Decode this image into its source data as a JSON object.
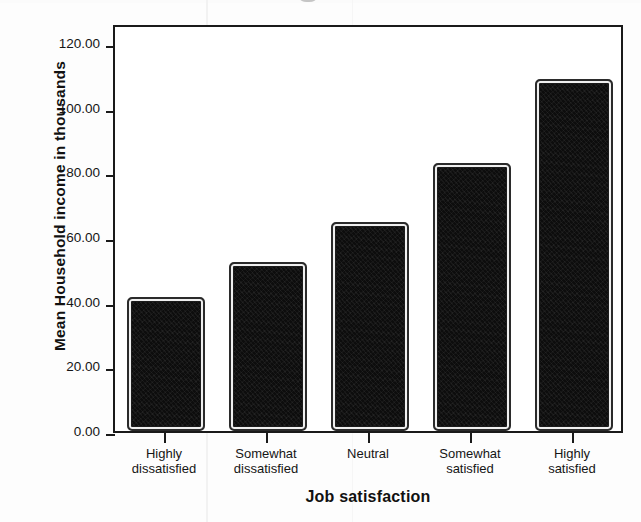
{
  "chart_data": {
    "type": "bar",
    "title": "",
    "xlabel": "Job satisfaction",
    "ylabel": "Mean Household income in thousands",
    "categories": [
      "Highly dissatisfied",
      "Somewhat dissatisfied",
      "Neutral",
      "Somewhat satisfied",
      "Highly satisfied"
    ],
    "category_lines": [
      [
        "Highly",
        "dissatisfied"
      ],
      [
        "Somewhat",
        "dissatisfied"
      ],
      [
        "Neutral",
        ""
      ],
      [
        "Somewhat",
        "satisfied"
      ],
      [
        "Highly",
        "satisfied"
      ]
    ],
    "values": [
      41.5,
      52.3,
      64.6,
      82.8,
      108.9
    ],
    "ylim": [
      0,
      130
    ],
    "yticks": [
      0,
      20,
      40,
      60,
      80,
      100,
      120
    ],
    "ytick_labels": [
      "0.00",
      "20.00",
      "40.00",
      "60.00",
      "80.00",
      "100.00",
      "120.00"
    ],
    "grid": false,
    "legend": null,
    "bar_color": "#0d0d0d",
    "bar_edge_color": "#efefef",
    "axis_color": "#1a1a1a",
    "background": "#ffffff"
  }
}
